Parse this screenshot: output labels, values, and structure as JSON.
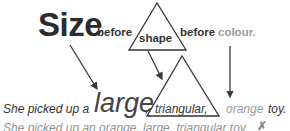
{
  "header": {
    "size": "Size",
    "before_1": "before",
    "shape": "shape",
    "before_2": "before",
    "colour": "colour."
  },
  "example_correct": {
    "prefix": "She picked up a",
    "size_word": "large",
    "comma": ",",
    "shape_word": "triangular,",
    "colour_word": "orange",
    "suffix": "toy."
  },
  "example_incorrect": {
    "text": "She picked up an orange, large, triangular toy.",
    "mark": "✗"
  },
  "colors": {
    "text": "#333333",
    "colour_word": "#9a9a9a",
    "arrow": "#3a3a3a"
  }
}
